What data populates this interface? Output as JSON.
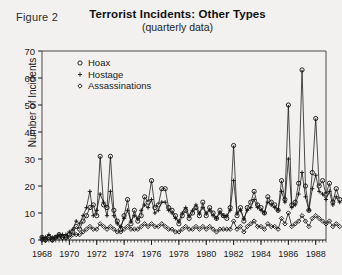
{
  "figure": {
    "number_label": "Figure 2"
  },
  "chart_data": {
    "type": "line",
    "title": "Terrorist Incidents: Other Types",
    "subtitle": "(quarterly data)",
    "xlabel": "",
    "ylabel": "Number of Incidents",
    "ylim": [
      0,
      70
    ],
    "yticks": [
      0,
      10,
      20,
      30,
      40,
      50,
      60,
      70
    ],
    "xlim": [
      1968,
      1988.75
    ],
    "xticks": [
      1968,
      1970,
      1972,
      1974,
      1976,
      1978,
      1980,
      1982,
      1984,
      1986,
      1988
    ],
    "xtick_labels": [
      "1968",
      "1970",
      "1972",
      "1974",
      "1976",
      "1978",
      "1980",
      "1982",
      "1984",
      "1986",
      "1988"
    ],
    "grid": false,
    "legend_position": "top-left-inside",
    "minor_ticks": "quarterly",
    "x_start": 1968.0,
    "x_step": 0.25,
    "series": [
      {
        "name": "Hoax",
        "marker": "open-circle",
        "color": "#111111",
        "values": [
          1,
          0,
          1,
          0,
          1,
          2,
          1,
          1,
          2,
          3,
          5,
          4,
          7,
          9,
          12,
          13,
          9,
          31,
          13,
          12,
          31,
          11,
          7,
          4,
          9,
          15,
          6,
          11,
          7,
          9,
          16,
          14,
          22,
          12,
          13,
          19,
          19,
          12,
          11,
          9,
          6,
          9,
          11,
          8,
          10,
          12,
          9,
          14,
          9,
          12,
          10,
          8,
          11,
          9,
          8,
          12,
          35,
          9,
          12,
          7,
          12,
          14,
          18,
          13,
          12,
          10,
          16,
          14,
          13,
          11,
          22,
          15,
          50,
          13,
          14,
          21,
          63,
          20,
          11,
          25,
          45,
          20,
          22,
          17,
          21,
          14,
          19,
          15
        ]
      },
      {
        "name": "Hostage",
        "marker": "plus",
        "color": "#111111",
        "values": [
          1,
          1,
          2,
          1,
          1,
          2,
          2,
          2,
          3,
          4,
          7,
          6,
          9,
          12,
          18,
          9,
          11,
          17,
          14,
          9,
          18,
          9,
          6,
          5,
          8,
          11,
          7,
          9,
          8,
          11,
          13,
          12,
          15,
          10,
          11,
          14,
          14,
          11,
          10,
          8,
          7,
          10,
          12,
          9,
          11,
          13,
          10,
          12,
          10,
          11,
          9,
          8,
          10,
          9,
          9,
          11,
          22,
          10,
          11,
          8,
          11,
          12,
          15,
          12,
          11,
          10,
          14,
          13,
          12,
          11,
          18,
          14,
          30,
          12,
          13,
          17,
          25,
          16,
          11,
          19,
          24,
          18,
          17,
          15,
          18,
          13,
          16,
          14
        ]
      },
      {
        "name": "Assassinations",
        "marker": "diamond",
        "color": "#111111",
        "values": [
          0,
          0,
          1,
          0,
          1,
          1,
          1,
          1,
          1,
          2,
          2,
          2,
          3,
          4,
          5,
          4,
          4,
          6,
          5,
          4,
          5,
          4,
          3,
          3,
          4,
          5,
          4,
          4,
          4,
          5,
          6,
          5,
          6,
          5,
          5,
          6,
          5,
          4,
          4,
          3,
          3,
          4,
          5,
          4,
          4,
          5,
          4,
          5,
          4,
          5,
          4,
          3,
          4,
          4,
          4,
          4,
          7,
          4,
          5,
          3,
          5,
          6,
          7,
          5,
          5,
          4,
          6,
          5,
          5,
          4,
          8,
          6,
          10,
          5,
          6,
          7,
          9,
          7,
          5,
          8,
          9,
          8,
          7,
          6,
          7,
          5,
          6,
          5
        ]
      }
    ]
  }
}
